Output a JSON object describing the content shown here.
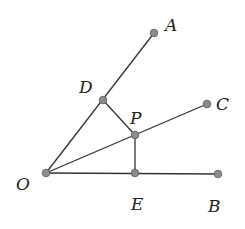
{
  "diagram": {
    "type": "geometry",
    "points": {
      "O": {
        "x": 46,
        "y": 173,
        "label": "O",
        "lx": 16,
        "ly": 190
      },
      "A": {
        "x": 154,
        "y": 33,
        "label": "A",
        "lx": 165,
        "ly": 31
      },
      "D": {
        "x": 103,
        "y": 100,
        "label": "D",
        "lx": 79,
        "ly": 93
      },
      "C": {
        "x": 207,
        "y": 104,
        "label": "C",
        "lx": 216,
        "ly": 110
      },
      "P": {
        "x": 135,
        "y": 135,
        "label": "P",
        "lx": 130,
        "ly": 124
      },
      "E": {
        "x": 135,
        "y": 173,
        "label": "E",
        "lx": 131,
        "ly": 210
      },
      "B": {
        "x": 218,
        "y": 174,
        "label": "B",
        "lx": 208,
        "ly": 212
      }
    },
    "segments": [
      [
        "O",
        "A"
      ],
      [
        "O",
        "C"
      ],
      [
        "O",
        "B"
      ],
      [
        "D",
        "P"
      ],
      [
        "P",
        "E"
      ]
    ],
    "colors": {
      "line": "#333333",
      "point_fill": "#8c8c8c",
      "label": "#222222"
    }
  }
}
